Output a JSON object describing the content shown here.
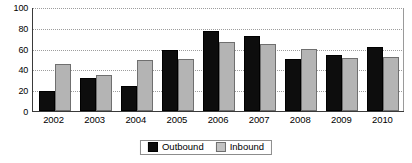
{
  "chart_data": {
    "type": "bar",
    "title": "",
    "subtitle": "",
    "xlabel": "",
    "ylabel": "",
    "categories": [
      "2002",
      "2003",
      "2004",
      "2005",
      "2006",
      "2007",
      "2008",
      "2009",
      "2010"
    ],
    "series": [
      {
        "name": "Outbound",
        "color": "#0d0d0d",
        "values": [
          19,
          32,
          24,
          59,
          77,
          72,
          50,
          54,
          62
        ]
      },
      {
        "name": "Inbound",
        "color": "#b4b4b4",
        "values": [
          45,
          35,
          49,
          50,
          66,
          64,
          60,
          51,
          52
        ]
      }
    ],
    "ylim": [
      0,
      100
    ],
    "ytick_labels": [
      "0",
      "20",
      "40",
      "60",
      "80",
      "100"
    ],
    "ytick_values": [
      0,
      20,
      40,
      60,
      80,
      100
    ],
    "grid": true,
    "grid_style": "dotted",
    "legend_position": "bottom-center",
    "annotations": []
  },
  "legend": {
    "entries": [
      {
        "label": "Outbound"
      },
      {
        "label": "Inbound"
      }
    ]
  }
}
